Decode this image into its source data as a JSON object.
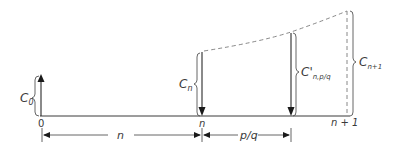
{
  "diagram": {
    "colors": {
      "line": "#3a3a3a",
      "dashed": "#7a7a7a",
      "background": "#ffffff"
    },
    "axis": {
      "ticks": [
        {
          "label": "0"
        },
        {
          "label": "n"
        },
        {
          "label": "n + 1"
        }
      ]
    },
    "flows": [
      {
        "id": "c0",
        "label_main": "C",
        "label_sub": "0",
        "direction": "up"
      },
      {
        "id": "cn",
        "label_main": "C",
        "label_sub": "n",
        "direction": "down"
      },
      {
        "id": "cpq",
        "label_main": "C'",
        "label_sub": "n,p/q",
        "direction": "down"
      },
      {
        "id": "cn1",
        "label_main": "C",
        "label_sub": "n+1",
        "direction": "none"
      }
    ],
    "dimensions": [
      {
        "label": "n"
      },
      {
        "label": "p/q"
      }
    ]
  }
}
